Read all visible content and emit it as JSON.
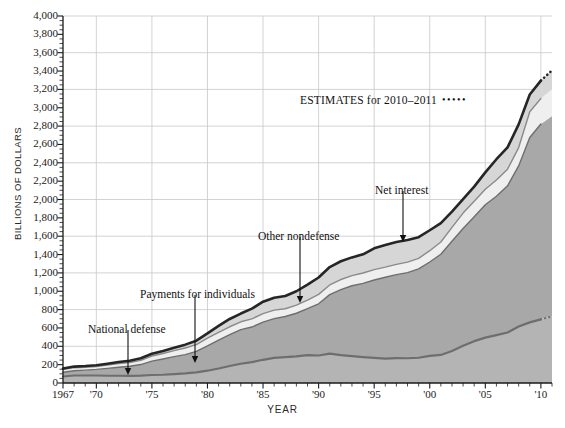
{
  "chart_data": {
    "type": "area",
    "title": "",
    "subtitle": "",
    "xlabel": "YEAR",
    "ylabel": "BILLIONS OF DOLLARS",
    "stacked": true,
    "grid": true,
    "legend_position": "inline-annotations",
    "xlim": [
      1967,
      2011
    ],
    "ylim": [
      0,
      4000
    ],
    "ytick_step": 200,
    "gridline_step": 400,
    "y_ticks": [
      "0",
      "200",
      "400",
      "600",
      "800",
      "1,000",
      "1,200",
      "1,400",
      "1,600",
      "1,800",
      "2,000",
      "2,200",
      "2,400",
      "2,600",
      "2,800",
      "3,000",
      "3,200",
      "3,400",
      "3,600",
      "3,800",
      "4,000"
    ],
    "x_ticks": [
      {
        "value": 1967,
        "label": "1967"
      },
      {
        "value": 1970,
        "label": "'70"
      },
      {
        "value": 1975,
        "label": "'75"
      },
      {
        "value": 1980,
        "label": "'80"
      },
      {
        "value": 1985,
        "label": "'85"
      },
      {
        "value": 1990,
        "label": "'90"
      },
      {
        "value": 1995,
        "label": "'95"
      },
      {
        "value": 2000,
        "label": "'00"
      },
      {
        "value": 2005,
        "label": "'05"
      },
      {
        "value": 2010,
        "label": "'10"
      }
    ],
    "x": [
      1967,
      1968,
      1969,
      1970,
      1971,
      1972,
      1973,
      1974,
      1975,
      1976,
      1977,
      1978,
      1979,
      1980,
      1981,
      1982,
      1983,
      1984,
      1985,
      1986,
      1987,
      1988,
      1989,
      1990,
      1991,
      1992,
      1993,
      1994,
      1995,
      1996,
      1997,
      1998,
      1999,
      2000,
      2001,
      2002,
      2003,
      2004,
      2005,
      2006,
      2007,
      2008,
      2009,
      2010,
      2011
    ],
    "series": [
      {
        "name": "National defense",
        "color": "#b4b4b4",
        "line_color": "#6e6e6e",
        "values": [
          71,
          82,
          82,
          82,
          79,
          79,
          77,
          80,
          87,
          90,
          97,
          104,
          116,
          134,
          158,
          185,
          210,
          227,
          253,
          273,
          282,
          290,
          304,
          300,
          320,
          303,
          292,
          282,
          273,
          266,
          271,
          270,
          275,
          295,
          306,
          349,
          405,
          456,
          495,
          522,
          551,
          616,
          661,
          694,
          726
        ]
      },
      {
        "name": "Payments for individuals",
        "color": "#a8a8a8",
        "line_color": "#6e6e6e",
        "values": [
          46,
          52,
          58,
          66,
          80,
          92,
          105,
          121,
          151,
          172,
          190,
          205,
          228,
          270,
          310,
          343,
          371,
          383,
          410,
          429,
          443,
          470,
          506,
          563,
          643,
          715,
          768,
          804,
          850,
          886,
          910,
          933,
          968,
          1024,
          1097,
          1196,
          1279,
          1357,
          1448,
          1514,
          1598,
          1750,
          2015,
          2129,
          2185
        ]
      },
      {
        "name": "Other nondefense",
        "color": "#efefef",
        "line_color": "#8a8a8a",
        "values": [
          30,
          33,
          32,
          32,
          36,
          41,
          42,
          46,
          56,
          60,
          66,
          72,
          74,
          84,
          85,
          85,
          86,
          89,
          93,
          92,
          84,
          88,
          93,
          103,
          106,
          110,
          110,
          113,
          113,
          111,
          112,
          114,
          116,
          123,
          134,
          151,
          168,
          167,
          169,
          176,
          182,
          200,
          281,
          277,
          290
        ]
      },
      {
        "name": "Net interest",
        "color": "#d6d6d6",
        "line_color": "#3a3a3a",
        "values": [
          11,
          12,
          13,
          14,
          15,
          16,
          18,
          22,
          24,
          27,
          30,
          37,
          43,
          53,
          69,
          85,
          90,
          111,
          130,
          136,
          139,
          152,
          169,
          184,
          195,
          199,
          199,
          203,
          232,
          241,
          244,
          241,
          230,
          223,
          206,
          171,
          153,
          160,
          184,
          227,
          237,
          253,
          187,
          196,
          207
        ]
      }
    ],
    "estimate_period": {
      "from": 2010,
      "to": 2011,
      "note_text": "ESTIMATES for 2010–2011",
      "dots": "•••••"
    },
    "annotations": [
      {
        "id": "national-defense",
        "label": "National defense",
        "text_x": 88,
        "text_y": 323,
        "arrow_x": 128,
        "arrow_y1": 330,
        "arrow_y2": 375
      },
      {
        "id": "payments-for-individuals",
        "label": "Payments for individuals",
        "text_x": 140,
        "text_y": 288,
        "arrow_x": 195,
        "arrow_y1": 295,
        "arrow_y2": 363
      },
      {
        "id": "other-nondefense",
        "label": "Other nondefense",
        "text_x": 258,
        "text_y": 230,
        "arrow_x": 300,
        "arrow_y1": 237,
        "arrow_y2": 303
      },
      {
        "id": "net-interest",
        "label": "Net interest",
        "text_x": 375,
        "text_y": 184,
        "arrow_x": 403,
        "arrow_y1": 191,
        "arrow_y2": 242
      }
    ],
    "colors": {
      "background": "#ffffff",
      "grid": "#c8c8c8",
      "axis": "#1a1a1a",
      "total_line": "#262626",
      "national_defense_fill": "#b4b4b4",
      "payments_fill": "#a8a8a8",
      "other_nondefense_fill": "#efefef",
      "net_interest_fill": "#d6d6d6"
    }
  }
}
